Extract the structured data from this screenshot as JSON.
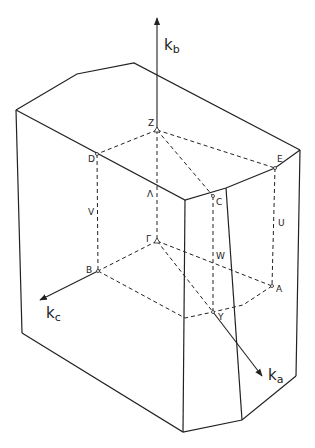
{
  "figure": {
    "type": "Brillouin zone (orthorhombic, truncated prism)",
    "axes": {
      "kb": {
        "base": "k",
        "sub": "b"
      },
      "ka": {
        "base": "k",
        "sub": "a"
      },
      "kc": {
        "base": "k",
        "sub": "c"
      }
    },
    "points": {
      "Z": "Z",
      "D": "D",
      "E": "E",
      "C": "C",
      "Gamma": "Γ",
      "B": "B",
      "A": "A",
      "Y": "Y"
    },
    "lines": {
      "Lambda": "Λ",
      "V": "V",
      "W": "W",
      "U": "U"
    },
    "stroke_color": "#222222",
    "background": "#ffffff"
  }
}
